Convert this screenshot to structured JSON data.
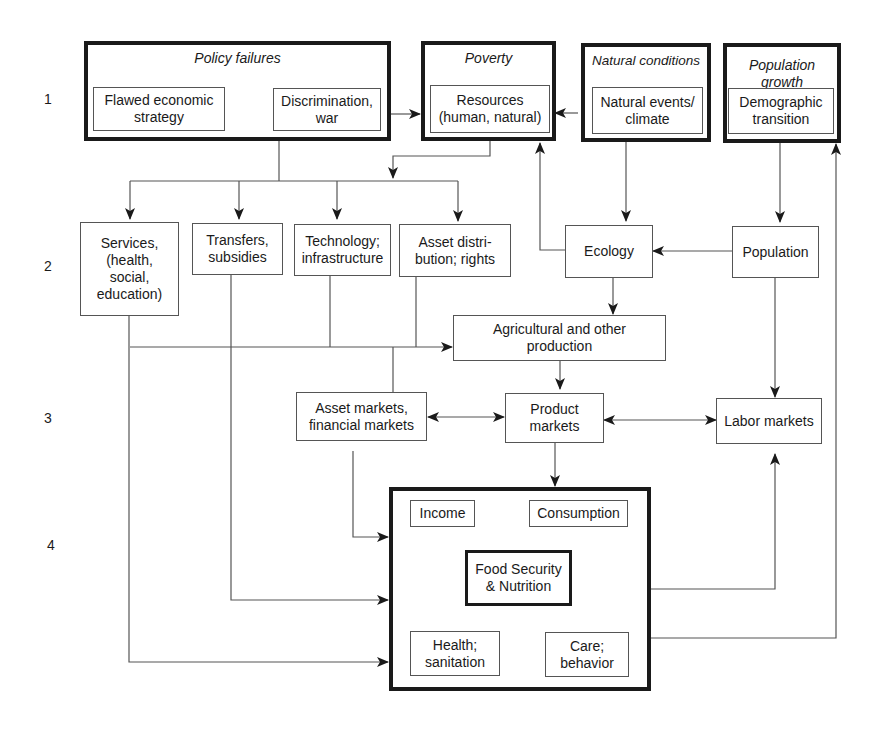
{
  "row_labels": [
    "1",
    "2",
    "3",
    "4"
  ],
  "groups": {
    "policy_failures": {
      "title": "Policy failures",
      "items": [
        "Flawed economic\nstrategy",
        "Discrimination,\nwar"
      ]
    },
    "poverty": {
      "title": "Poverty",
      "items": [
        "Resources\n(human, natural)"
      ]
    },
    "natural_conditions": {
      "title": "Natural conditions",
      "items": [
        "Natural events/\nclimate"
      ]
    },
    "population_growth": {
      "title": "Population\ngrowth",
      "items": [
        "Demographic\ntransition"
      ]
    }
  },
  "level2": {
    "services": "Services,\n(health,\nsocial,\neducation)",
    "transfers": "Transfers,\nsubsidies",
    "technology": "Technology;\ninfrastructure",
    "asset_distribution": "Asset distri-\nbution; rights",
    "ecology": "Ecology",
    "population": "Population",
    "agricultural_production": "Agricultural and other\nproduction"
  },
  "level3": {
    "asset_markets": "Asset markets,\nfinancial markets",
    "product_markets": "Product\nmarkets",
    "labor_markets": "Labor markets"
  },
  "level4": {
    "income": "Income",
    "consumption": "Consumption",
    "food_security": "Food Security\n& Nutrition",
    "health": "Health;\nsanitation",
    "care": "Care;\nbehavior"
  },
  "colors": {
    "line": "#555555",
    "thick_border": "#1a1a1a",
    "background": "#ffffff"
  }
}
